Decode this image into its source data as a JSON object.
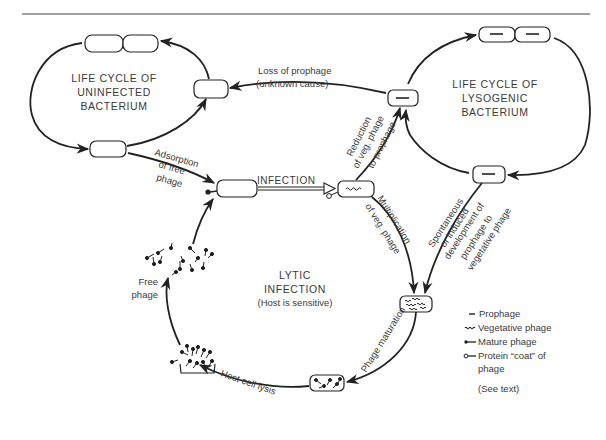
{
  "diagram": {
    "type": "biological cycle diagram",
    "cycles": {
      "uninfected": {
        "title_lines": [
          "LIFE CYCLE OF",
          "UNINFECTED",
          "BACTERIUM"
        ]
      },
      "lysogenic": {
        "title_lines": [
          "LIFE CYCLE OF",
          "LYSOGENIC",
          "BACTERIUM"
        ]
      },
      "lytic": {
        "title_lines": [
          "LYTIC",
          "INFECTION",
          "(Host is sensitive)"
        ]
      }
    },
    "transitions": {
      "loss_of_prophage": [
        "Loss of prophage",
        "(unknown cause)"
      ],
      "adsorption": [
        "Adsorption",
        "of free",
        "phage"
      ],
      "infection": "INFECTION",
      "reduction": [
        "Reduction",
        "of veg. phage",
        "to prophage"
      ],
      "multiplication": [
        "Multiplication",
        "of veg. phage"
      ],
      "spontaneous": [
        "Spontaneous",
        "or induced",
        "development of",
        "prophage to",
        "vegetative phage"
      ],
      "maturation": "Phage maturation",
      "lysis": "Host cell lysis",
      "free_phage": [
        "Free",
        "phage"
      ]
    },
    "legend": {
      "items": [
        {
          "icon": "prophage-dash-icon",
          "label": "Prophage"
        },
        {
          "icon": "vegetative-wave-icon",
          "label": "Vegetative phage"
        },
        {
          "icon": "mature-phage-icon",
          "label": "Mature phage"
        },
        {
          "icon": "protein-coat-icon",
          "label": "Protein “coat” of"
        }
      ],
      "continuation": "phage",
      "note": "(See text)"
    },
    "colors": {
      "ink": "#222222",
      "text": "#3a3a3a",
      "background": "#ffffff"
    }
  }
}
